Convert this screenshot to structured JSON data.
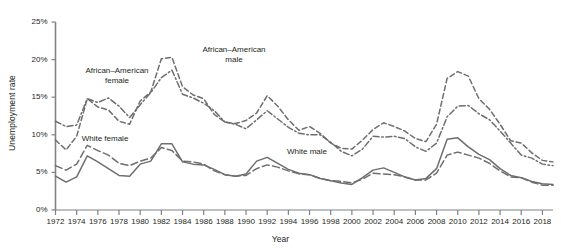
{
  "chart_data": {
    "type": "line",
    "title": "",
    "xlabel": "Year",
    "ylabel": "Unemployment rate",
    "xlim": [
      1972,
      2019
    ],
    "ylim": [
      0,
      25
    ],
    "grid": false,
    "legend_position": "inline-annotations",
    "y_ticks": [
      0,
      5,
      10,
      15,
      20,
      25
    ],
    "y_tick_labels": [
      "0%",
      "5%",
      "10%",
      "15%",
      "20%",
      "25%"
    ],
    "x_ticks": [
      1972,
      1974,
      1976,
      1978,
      1980,
      1982,
      1984,
      1986,
      1988,
      1990,
      1992,
      1994,
      1996,
      1998,
      2000,
      2002,
      2004,
      2006,
      2008,
      2010,
      2012,
      2014,
      2016,
      2018
    ],
    "x_tick_labels": [
      "1972",
      "1974",
      "1976",
      "1978",
      "1980",
      "1982",
      "1984",
      "1986",
      "1988",
      "1990",
      "1992",
      "1994",
      "1996",
      "1998",
      "2000",
      "2002",
      "2004",
      "2006",
      "2008",
      "2010",
      "2012",
      "2014",
      "2016",
      "2018"
    ],
    "x": [
      1972,
      1973,
      1974,
      1975,
      1976,
      1977,
      1978,
      1979,
      1980,
      1981,
      1982,
      1983,
      1984,
      1985,
      1986,
      1987,
      1988,
      1989,
      1990,
      1991,
      1992,
      1993,
      1994,
      1995,
      1996,
      1997,
      1998,
      1999,
      2000,
      2001,
      2002,
      2003,
      2004,
      2005,
      2006,
      2007,
      2008,
      2009,
      2010,
      2011,
      2012,
      2013,
      2014,
      2015,
      2016,
      2017,
      2018,
      2019
    ],
    "series": [
      {
        "name": "African-American male",
        "style": "dashed",
        "color": "#6d6e71",
        "values": [
          9.3,
          8.0,
          9.8,
          14.8,
          13.7,
          13.3,
          11.8,
          11.4,
          14.5,
          15.7,
          20.1,
          20.3,
          16.4,
          15.3,
          14.8,
          12.7,
          11.7,
          11.5,
          11.9,
          12.9,
          15.2,
          13.8,
          12.0,
          10.6,
          11.1,
          10.2,
          8.9,
          8.2,
          8.1,
          9.3,
          10.7,
          11.6,
          11.1,
          10.5,
          9.5,
          9.1,
          11.4,
          17.5,
          18.4,
          17.8,
          14.8,
          13.4,
          11.4,
          9.2,
          8.9,
          7.6,
          6.6,
          6.4
        ]
      },
      {
        "name": "African-American female",
        "style": "dash-dot",
        "color": "#6d6e71",
        "values": [
          11.8,
          11.1,
          11.3,
          14.8,
          14.3,
          14.9,
          13.8,
          12.3,
          14.0,
          15.6,
          17.6,
          18.6,
          15.4,
          14.9,
          14.2,
          13.2,
          11.7,
          11.4,
          10.8,
          12.0,
          13.2,
          12.1,
          11.0,
          10.2,
          10.0,
          10.0,
          9.0,
          7.8,
          7.2,
          8.1,
          9.8,
          9.7,
          9.8,
          9.5,
          8.4,
          7.8,
          8.9,
          12.4,
          13.8,
          13.9,
          12.8,
          12.0,
          10.5,
          8.9,
          7.3,
          6.9,
          6.1,
          5.9
        ]
      },
      {
        "name": "White female",
        "style": "long-dashed",
        "color": "#6d6e71",
        "values": [
          5.9,
          5.3,
          6.1,
          8.6,
          7.9,
          7.3,
          6.2,
          5.9,
          6.5,
          6.9,
          8.3,
          7.9,
          6.5,
          6.4,
          6.1,
          5.2,
          4.7,
          4.5,
          4.6,
          5.5,
          6.0,
          5.7,
          5.2,
          4.8,
          4.7,
          4.2,
          3.9,
          3.8,
          3.6,
          4.1,
          4.9,
          4.8,
          4.7,
          4.4,
          4.0,
          4.0,
          4.9,
          7.3,
          7.7,
          7.3,
          6.9,
          6.2,
          5.2,
          4.4,
          4.3,
          3.7,
          3.3,
          3.3
        ]
      },
      {
        "name": "White male",
        "style": "solid",
        "color": "#6d6e71",
        "values": [
          4.5,
          3.7,
          4.4,
          7.2,
          6.4,
          5.5,
          4.6,
          4.5,
          6.1,
          6.5,
          8.8,
          8.8,
          6.4,
          6.1,
          6.0,
          5.4,
          4.7,
          4.5,
          4.8,
          6.5,
          7.0,
          6.2,
          5.4,
          4.9,
          4.7,
          4.2,
          3.9,
          3.6,
          3.4,
          4.3,
          5.3,
          5.6,
          5.0,
          4.4,
          4.0,
          4.2,
          5.5,
          9.4,
          9.6,
          8.4,
          7.4,
          6.7,
          5.5,
          4.6,
          4.3,
          3.8,
          3.5,
          3.4
        ]
      }
    ],
    "annotations": [
      {
        "id": "african-american-female",
        "text": "African–American\nfemale"
      },
      {
        "id": "african-american-male",
        "text": "African–American\nmale"
      },
      {
        "id": "white-female",
        "text": "White female"
      },
      {
        "id": "white-male",
        "text": "White male"
      }
    ]
  },
  "colors": {
    "line": "#6d6e71",
    "axis": "#808285",
    "text": "#231f20",
    "background": "#ffffff"
  }
}
